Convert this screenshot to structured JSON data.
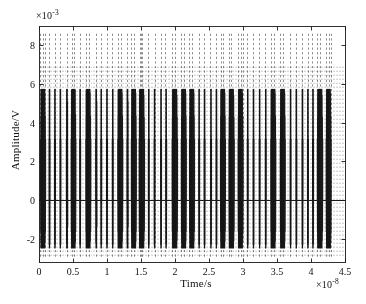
{
  "figure": {
    "background_color": "#ffffff",
    "axes_color": "#1a1a1a",
    "signal_color": "#1a1a1a"
  },
  "chart_data": {
    "type": "line",
    "title": "",
    "subtitle": "",
    "xlabel": "Time/s",
    "ylabel": "Amplitude/V",
    "x_exponent_label": "×10",
    "x_exponent_value": "-8",
    "y_exponent_label": "×10",
    "y_exponent_value": "-3",
    "x_multiplier": 1e-08,
    "y_multiplier": 0.001,
    "xlim": [
      0,
      4.5
    ],
    "ylim": [
      -3.2,
      9.0
    ],
    "xticks": [
      0,
      0.5,
      1,
      1.5,
      2,
      2.5,
      3,
      3.5,
      4,
      4.5
    ],
    "xticklabels": [
      "0",
      "0.5",
      "1",
      "1.5",
      "2",
      "2.5",
      "3",
      "3.5",
      "4",
      "4.5"
    ],
    "yticks": [
      -2,
      0,
      2,
      4,
      6,
      8
    ],
    "yticklabels": [
      "-2",
      "0",
      "2",
      "4",
      "6",
      "8"
    ],
    "grid": false,
    "legend": null,
    "annotations": [],
    "series": [
      {
        "name": "burst-modulated carrier",
        "description": "Dense oscillatory bursts of a high-frequency carrier, positive peaks near 5.75e-3 V and negative troughs near -2.5e-3 V, separated by quiet intervals at 0 V.",
        "positive_peak": 5.75,
        "negative_peak": -2.5,
        "baseline": 0,
        "carrier_cycles_per_unit": 150,
        "bursts": [
          {
            "start": 0.02,
            "end": 0.1
          },
          {
            "start": 0.145,
            "end": 0.165
          },
          {
            "start": 0.225,
            "end": 0.245
          },
          {
            "start": 0.305,
            "end": 0.325
          },
          {
            "start": 0.4,
            "end": 0.425
          },
          {
            "start": 0.47,
            "end": 0.545
          },
          {
            "start": 0.595,
            "end": 0.615
          },
          {
            "start": 0.685,
            "end": 0.765
          },
          {
            "start": 0.83,
            "end": 0.855
          },
          {
            "start": 0.905,
            "end": 0.925
          },
          {
            "start": 0.99,
            "end": 1.01
          },
          {
            "start": 1.075,
            "end": 1.095
          },
          {
            "start": 1.155,
            "end": 1.235
          },
          {
            "start": 1.29,
            "end": 1.315
          },
          {
            "start": 1.355,
            "end": 1.435
          },
          {
            "start": 1.47,
            "end": 1.555
          },
          {
            "start": 1.605,
            "end": 1.625
          },
          {
            "start": 1.69,
            "end": 1.71
          },
          {
            "start": 1.785,
            "end": 1.805
          },
          {
            "start": 1.86,
            "end": 1.88
          },
          {
            "start": 1.955,
            "end": 2.04
          },
          {
            "start": 2.09,
            "end": 2.17
          },
          {
            "start": 2.21,
            "end": 2.29
          },
          {
            "start": 2.345,
            "end": 2.365
          },
          {
            "start": 2.425,
            "end": 2.445
          },
          {
            "start": 2.52,
            "end": 2.54
          },
          {
            "start": 2.6,
            "end": 2.62
          },
          {
            "start": 2.665,
            "end": 2.745
          },
          {
            "start": 2.79,
            "end": 2.875
          },
          {
            "start": 2.925,
            "end": 3.005
          },
          {
            "start": 3.06,
            "end": 3.08
          },
          {
            "start": 3.145,
            "end": 3.165
          },
          {
            "start": 3.235,
            "end": 3.255
          },
          {
            "start": 3.325,
            "end": 3.345
          },
          {
            "start": 3.405,
            "end": 3.485
          },
          {
            "start": 3.545,
            "end": 3.625
          },
          {
            "start": 3.69,
            "end": 3.71
          },
          {
            "start": 3.775,
            "end": 3.795
          },
          {
            "start": 3.865,
            "end": 3.885
          },
          {
            "start": 3.945,
            "end": 3.965
          },
          {
            "start": 4.02,
            "end": 4.04
          },
          {
            "start": 4.09,
            "end": 4.175
          },
          {
            "start": 4.22,
            "end": 4.3
          }
        ],
        "ticks_overlay": [
          0.02,
          0.06,
          0.085,
          0.15,
          0.23,
          0.31,
          0.405,
          0.48,
          0.51,
          0.6,
          0.69,
          0.73,
          0.84,
          0.91,
          1.0,
          1.08,
          1.16,
          1.2,
          1.29,
          1.36,
          1.4,
          1.48,
          1.5,
          1.52,
          1.61,
          1.7,
          1.79,
          1.86,
          1.96,
          2.0,
          2.09,
          2.13,
          2.21,
          2.25,
          2.35,
          2.43,
          2.52,
          2.6,
          2.67,
          2.71,
          2.79,
          2.83,
          2.93,
          2.97,
          3.0,
          3.06,
          3.15,
          3.24,
          3.33,
          3.41,
          3.45,
          3.55,
          3.59,
          3.69,
          3.78,
          3.87,
          3.95,
          4.02,
          4.09,
          4.13,
          4.22,
          4.26,
          4.3
        ]
      }
    ]
  }
}
